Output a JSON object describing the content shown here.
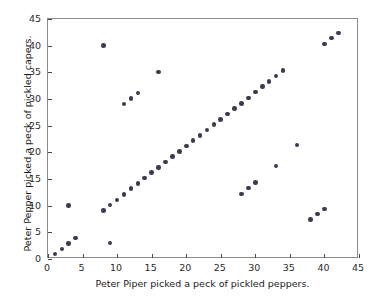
{
  "chart_data": {
    "type": "scatter",
    "title": "",
    "xlabel": "Peter Piper picked a peck of pickled peppers.",
    "ylabel": "Peter Pepper picked a peck of pickled capers.",
    "xlim": [
      0,
      45
    ],
    "ylim": [
      0,
      45
    ],
    "xticks": [
      0,
      5,
      10,
      15,
      20,
      25,
      30,
      35,
      40,
      45
    ],
    "yticks": [
      0,
      5,
      10,
      15,
      20,
      25,
      30,
      35,
      40,
      45
    ],
    "xticklabels": [
      "0",
      "5",
      "10",
      "15",
      "20",
      "25",
      "30",
      "35",
      "40",
      "45"
    ],
    "yticklabels": [
      "0",
      "5",
      "10",
      "15",
      "20",
      "25",
      "30",
      "35",
      "40",
      "45"
    ],
    "grid": false,
    "legend": null,
    "marker_color": "#3b3b4f",
    "marker_size": 4.6,
    "axes_color": "#8a8a8a",
    "background": "#ffffff",
    "points": [
      [
        1,
        0.9
      ],
      [
        2,
        1.9
      ],
      [
        3,
        2.9
      ],
      [
        3,
        10.0
      ],
      [
        4,
        3.9
      ],
      [
        8,
        40.0
      ],
      [
        8,
        9.1
      ],
      [
        9,
        3.0
      ],
      [
        9,
        10.1
      ],
      [
        10,
        11.1
      ],
      [
        11,
        12.1
      ],
      [
        11,
        29.1
      ],
      [
        12,
        13.2
      ],
      [
        12,
        30.1
      ],
      [
        13,
        14.2
      ],
      [
        13,
        31.1
      ],
      [
        14,
        15.2
      ],
      [
        15,
        16.2
      ],
      [
        16,
        17.2
      ],
      [
        16,
        35.1
      ],
      [
        17,
        18.2
      ],
      [
        18,
        19.2
      ],
      [
        19,
        20.2
      ],
      [
        20,
        21.2
      ],
      [
        21,
        22.2
      ],
      [
        22,
        23.2
      ],
      [
        23,
        24.2
      ],
      [
        24,
        25.2
      ],
      [
        25,
        26.2
      ],
      [
        26,
        27.2
      ],
      [
        27,
        28.2
      ],
      [
        28,
        29.2
      ],
      [
        28,
        12.2
      ],
      [
        29,
        30.2
      ],
      [
        29,
        13.3
      ],
      [
        30,
        31.3
      ],
      [
        30,
        14.3
      ],
      [
        31,
        32.3
      ],
      [
        32,
        33.3
      ],
      [
        33,
        34.3
      ],
      [
        33,
        17.4
      ],
      [
        34,
        35.3
      ],
      [
        36,
        21.4
      ],
      [
        38,
        7.4
      ],
      [
        39,
        8.4
      ],
      [
        40,
        9.4
      ],
      [
        40,
        40.3
      ],
      [
        41,
        41.4
      ],
      [
        42,
        42.4
      ]
    ]
  }
}
